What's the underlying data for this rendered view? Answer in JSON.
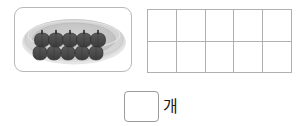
{
  "page": {
    "background_color": "#ffffff"
  },
  "picture_panel": {
    "name": "fruit plate illustration",
    "panel_border_color": "#b8b8b8",
    "plate": {
      "shape": "oval",
      "rim_color": "#d9d9d9",
      "inner_color": "#c6c6c6",
      "shadow_color": "#e8e8e8"
    },
    "fruits": {
      "item_name": "plum",
      "item_color": "#4a4a4a",
      "stem_color": "#1a1a1a",
      "rows": 2,
      "per_row": 5,
      "total": 10
    }
  },
  "ten_frame": {
    "name": "ten frame",
    "columns": 5,
    "rows": 2,
    "total_cells": 10,
    "line_color": "#b0b0b0",
    "cells": [
      {
        "value": ""
      },
      {
        "value": ""
      },
      {
        "value": ""
      },
      {
        "value": ""
      },
      {
        "value": ""
      },
      {
        "value": ""
      },
      {
        "value": ""
      },
      {
        "value": ""
      },
      {
        "value": ""
      },
      {
        "value": ""
      }
    ]
  },
  "answer": {
    "box_value": "",
    "box_placeholder": "",
    "unit_label": "개",
    "box_border_color": "#9a9a9a"
  }
}
